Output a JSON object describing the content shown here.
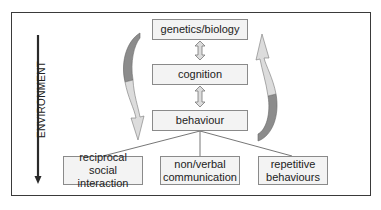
{
  "diagram": {
    "side_label": "ENVIRONMENT",
    "levels": [
      {
        "id": "genetics",
        "label": "genetics/biology"
      },
      {
        "id": "cognition",
        "label": "cognition"
      },
      {
        "id": "behaviour",
        "label": "behaviour"
      }
    ],
    "outcomes": [
      {
        "id": "social",
        "line1": "reciprocal",
        "line2": "social interaction"
      },
      {
        "id": "communication",
        "line1": "non/verbal",
        "line2": "communication"
      },
      {
        "id": "repetitive",
        "line1": "repetitive",
        "line2": "behaviours"
      }
    ],
    "colors": {
      "frame": "#3a3a3a",
      "box_fill": "#f3f3f3",
      "box_border": "#8a8a8a",
      "arrow_dark": "#8c8c8c",
      "arrow_light": "#d9d9d9",
      "lines": "#666666"
    }
  }
}
